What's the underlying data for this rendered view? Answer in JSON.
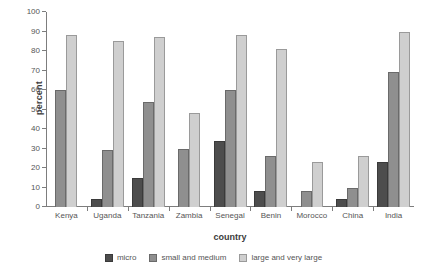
{
  "chart_data": {
    "type": "bar",
    "title": "",
    "xlabel": "country",
    "ylabel": "percent",
    "ylim": [
      0,
      100
    ],
    "ytick_step": 10,
    "yticks": [
      0,
      10,
      20,
      30,
      40,
      50,
      60,
      70,
      80,
      90,
      100
    ],
    "grid": false,
    "legend_position": "bottom",
    "categories": [
      "Kenya",
      "Uganda",
      "Tanzania",
      "Zambia",
      "Senegal",
      "Benin",
      "Morocco",
      "China",
      "India"
    ],
    "series": [
      {
        "name": "micro",
        "color": "#4d4d4d",
        "values": [
          0,
          4,
          15,
          0,
          34,
          8,
          0,
          4,
          23
        ]
      },
      {
        "name": "small and medium",
        "color": "#8f8f8f",
        "values": [
          60,
          29,
          54,
          30,
          60,
          26,
          8,
          10,
          69
        ]
      },
      {
        "name": "large and very large",
        "color": "#cfcfcf",
        "values": [
          88,
          85,
          87,
          48,
          88,
          81,
          23,
          26,
          90
        ]
      }
    ]
  }
}
